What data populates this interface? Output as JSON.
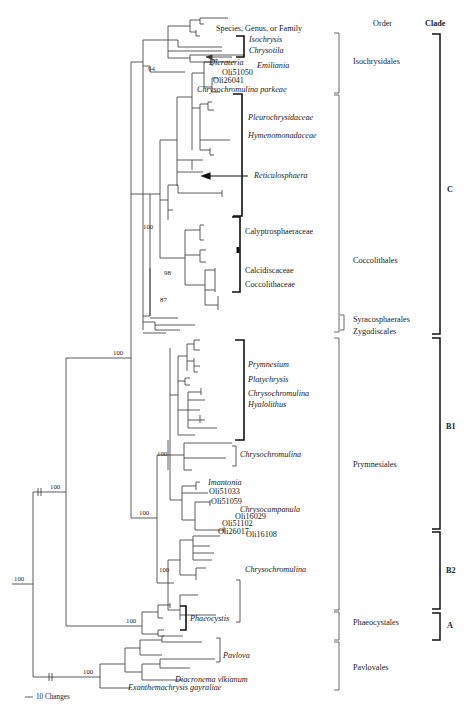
{
  "headers": {
    "taxa": "Species, Genus, or Family",
    "order": "Order",
    "clade": "Clade"
  },
  "taxa_labels": [
    {
      "id": "isochrysis",
      "text": "Isochrysis",
      "italic": true
    },
    {
      "id": "chrysotila",
      "text": "Chrysotila",
      "italic": true
    },
    {
      "id": "dicrateria",
      "text": "Dicrateria",
      "italic": true
    },
    {
      "id": "emiliania",
      "text": "Emiliania",
      "italic": true
    },
    {
      "id": "oli51050",
      "text": "Oli51050",
      "italic": false
    },
    {
      "id": "oli26041",
      "text": "Oli26041",
      "italic": false
    },
    {
      "id": "chrysochromulina-parkeae",
      "text": "Chrysochromulina parkeae",
      "italic": true
    },
    {
      "id": "pleurochrysidaceae",
      "text": "Pleurochrysidaceae",
      "italic": true
    },
    {
      "id": "hymenomonadaceae",
      "text": "Hymenomonadaceae",
      "italic": true
    },
    {
      "id": "reticulosphaera",
      "text": "Reticulosphaera",
      "italic": true
    },
    {
      "id": "calyptrosphaeraceae",
      "text": "Calyptrosphaeraceae",
      "italic": false
    },
    {
      "id": "calcidiscaceae",
      "text": "Calcidiscaceae",
      "italic": false
    },
    {
      "id": "coccolithaceae",
      "text": "Coccolithaceae",
      "italic": false
    },
    {
      "id": "prymnesium",
      "text": "Prymnesium",
      "italic": true
    },
    {
      "id": "platychrysis",
      "text": "Platychrysis",
      "italic": true
    },
    {
      "id": "chrysochromulina-1",
      "text": "Chrysochromulina",
      "italic": true
    },
    {
      "id": "hyalolithus",
      "text": "Hyalolithus",
      "italic": true
    },
    {
      "id": "chrysochromulina-2",
      "text": "Chrysochromulina",
      "italic": true
    },
    {
      "id": "imantonia",
      "text": "Imantonia",
      "italic": true
    },
    {
      "id": "oli51033",
      "text": "Oli51033",
      "italic": false
    },
    {
      "id": "oli51059",
      "text": "Oli51059",
      "italic": false
    },
    {
      "id": "chrysocampanula",
      "text": "Chrysocampanula",
      "italic": true
    },
    {
      "id": "oli16029",
      "text": "Oli16029",
      "italic": false
    },
    {
      "id": "oli51102",
      "text": "Oli51102",
      "italic": false
    },
    {
      "id": "oli26017",
      "text": "Oli26017",
      "italic": false
    },
    {
      "id": "oli16108",
      "text": "Oli16108",
      "italic": false
    },
    {
      "id": "chrysochromulina-3",
      "text": "Chrysochromulina",
      "italic": true
    },
    {
      "id": "phaeocystis",
      "text": "Phaeocystis",
      "italic": true
    },
    {
      "id": "pavlova",
      "text": "Pavlova",
      "italic": true
    },
    {
      "id": "diacronema-vlkianum",
      "text": "Diacronema vlkianum",
      "italic": true
    },
    {
      "id": "exanthemachrysis-gayraliae",
      "text": "Exanthemachrysis gayraliae",
      "italic": true
    }
  ],
  "orders": [
    {
      "id": "isochrysidales",
      "text": "Isochrysidales"
    },
    {
      "id": "coccolithales",
      "text": "Coccolithales"
    },
    {
      "id": "syracosphaerales",
      "text": "Syracosphaerales"
    },
    {
      "id": "zygodiscales",
      "text": "Zygodiscales"
    },
    {
      "id": "prymnesiales",
      "text": "Prymnesiales"
    },
    {
      "id": "phaeocystales",
      "text": "Phaeocystales"
    },
    {
      "id": "pavlovales",
      "text": "Pavlovales"
    }
  ],
  "clades": [
    {
      "id": "c",
      "text": "C"
    },
    {
      "id": "b1",
      "text": "B1"
    },
    {
      "id": "b2",
      "text": "B2"
    },
    {
      "id": "a",
      "text": "A"
    }
  ],
  "bootstrap_values": [
    {
      "id": "root",
      "text": "100"
    },
    {
      "id": "haptophyta",
      "text": "100"
    },
    {
      "id": "prymnesiophyceae-core",
      "text": "100"
    },
    {
      "id": "isochrysidales",
      "text": "94"
    },
    {
      "id": "coccolithales",
      "text": "100"
    },
    {
      "id": "coccolith-98",
      "text": "98"
    },
    {
      "id": "coccolith-87",
      "text": "87"
    },
    {
      "id": "prymnesiales",
      "text": "100"
    },
    {
      "id": "b1",
      "text": "100"
    },
    {
      "id": "b2",
      "text": "100"
    },
    {
      "id": "phaeocystis",
      "text": "100"
    },
    {
      "id": "pavlovales",
      "text": "100"
    }
  ],
  "scale_bar": {
    "text": "10 Changes"
  }
}
